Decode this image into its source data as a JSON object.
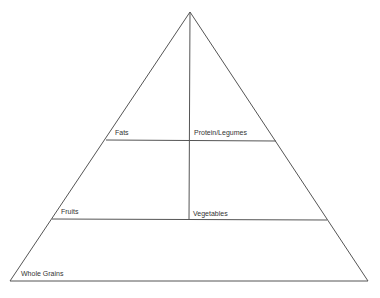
{
  "diagram": {
    "type": "food-pyramid",
    "colors": {
      "line": "#555555",
      "text": "#333333",
      "background": "#ffffff"
    },
    "tiers": [
      {
        "name": "top",
        "sections": [
          {
            "label": "Fats"
          },
          {
            "label": "Protein/Legumes"
          }
        ]
      },
      {
        "name": "middle",
        "sections": [
          {
            "label": "Fruits"
          },
          {
            "label": "Vegetables"
          }
        ]
      },
      {
        "name": "base",
        "sections": [
          {
            "label": "Whole Grains"
          }
        ]
      }
    ]
  }
}
